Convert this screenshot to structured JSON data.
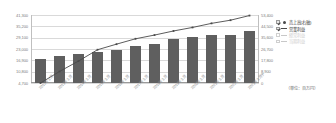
{
  "chart_data": {
    "type": "bar",
    "title": "",
    "xlabel": "",
    "ylabel": "",
    "grid": true,
    "legend_position": "right",
    "unit_note": "（単位：百万円）",
    "categories": [
      "2012年3月",
      "2013年3月",
      "2014年3月",
      "2015年3月",
      "2016年3月",
      "2017年3月",
      "2018年3月",
      "2019年3月",
      "2020年3月",
      "2021年3月",
      "2022年3月",
      "2023年3月予"
    ],
    "left_axis": {
      "name": "営業利益",
      "ticks": [
        "4,700",
        "10,800",
        "16,900",
        "23,000",
        "29,100",
        "35,200",
        "41,300"
      ],
      "tick_values": [
        4700,
        10800,
        16900,
        23000,
        29100,
        35200,
        41300
      ],
      "ylim": [
        4700,
        41300
      ]
    },
    "right_axis": {
      "name": "売上高(右軸)",
      "ticks": [
        "0",
        "8,900",
        "17,800",
        "26,700",
        "35,600",
        "44,500",
        "53,400"
      ],
      "tick_values": [
        0,
        8900,
        17800,
        26700,
        35600,
        44500,
        53400
      ],
      "ylim": [
        0,
        53400
      ]
    },
    "series": [
      {
        "name": "売上高(右軸)",
        "type": "bar",
        "axis": "right",
        "color": "#5f5f5f",
        "values": [
          18900,
          21600,
          23000,
          24600,
          26300,
          29000,
          30900,
          34300,
          35800,
          37600,
          37800,
          41200
        ]
      },
      {
        "name": "営業利益",
        "type": "line",
        "axis": "left",
        "color": "#4a4a4a",
        "values": [
          4700,
          10900,
          16500,
          22600,
          25600,
          28500,
          30500,
          32700,
          34600,
          36800,
          38500,
          41000
        ]
      }
    ],
    "legend": [
      {
        "label": "売上高(右軸)",
        "marker": "dot",
        "checked": true,
        "enabled": true
      },
      {
        "label": "営業利益",
        "marker": "line",
        "checked": true,
        "enabled": true
      },
      {
        "label": "経常利益",
        "marker": "line",
        "checked": false,
        "enabled": false
      },
      {
        "label": "当期利益",
        "marker": "line",
        "checked": false,
        "enabled": false
      }
    ]
  }
}
